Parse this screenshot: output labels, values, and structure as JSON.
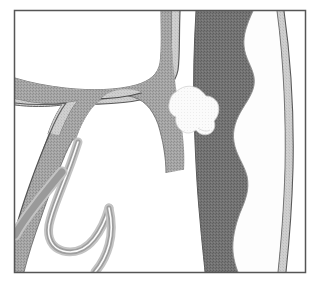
{
  "figure": {
    "title": "Cerebral vessel junction illustration",
    "type": "anatomical-line-drawing",
    "style": "grayscale halftone stipple",
    "background_color": "#ffffff",
    "frame": {
      "name": "figure-border",
      "color": "#555555",
      "stroke_width": 1.5,
      "x": 14,
      "y": 10,
      "width": 292,
      "height": 263
    },
    "palette": {
      "outline_dark": "#4a4a4a",
      "outline_mid": "#6f6f6f",
      "wall_light": "#c9c9c9",
      "vessel_fill_light": "#9e9e9e",
      "vessel_fill_dark": "#6e6e6e",
      "lumen_white": "#fdfdfd",
      "mass_white": "#fbfbfb",
      "mass_shade": "#e4e4e4",
      "background": "#ffffff"
    },
    "structures": [
      {
        "name": "horizontal-vessel",
        "label": "Horizontal artery",
        "fill": "#9e9e9e",
        "description": "Broad light-gray vessel entering from the left edge and arching to the right toward the junction"
      },
      {
        "name": "inferior-branch-vessel",
        "label": "Descending branch",
        "fill": "#9e9e9e",
        "description": "Branch descending from the horizontal vessel and curving down to the lower left"
      },
      {
        "name": "bifurcation-vessel",
        "label": "Lower bifurcation",
        "fill": "#9e9e9e",
        "description": "Y-shaped division in the lower left quadrant with a pale inner lumen"
      },
      {
        "name": "vertical-vessel",
        "label": "Vertical dark vessel",
        "fill": "#6e6e6e",
        "description": "Dark vertical channel spanning the full height on the right side"
      },
      {
        "name": "vessel-lumen",
        "label": "Patent lumen",
        "fill": "#fdfdfd",
        "description": "Wavy white channel running inside the right-hand vertical vessel"
      },
      {
        "name": "lesion-mass",
        "label": "Lobulated mass",
        "fill": "#fbfbfb",
        "description": "Irregular white lobulated mass at the junction of the horizontal and vertical vessels"
      }
    ]
  }
}
